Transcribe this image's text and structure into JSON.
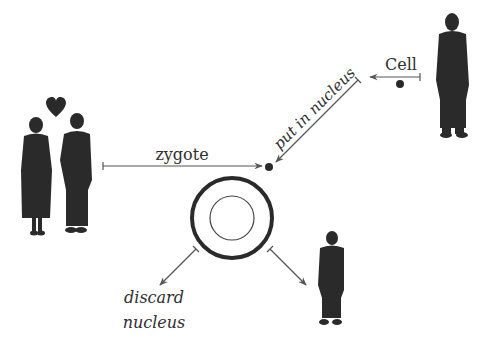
{
  "diagram": {
    "labels": {
      "zygote": "zygote",
      "cell": "Cell",
      "put_in_nucleus": "put in nucleus",
      "discard_line1": "discard",
      "discard_line2": "nucleus"
    },
    "nodes": [
      {
        "id": "parents",
        "kind": "couple-silhouette",
        "note": "heart-icon above"
      },
      {
        "id": "donor",
        "kind": "person-silhouette"
      },
      {
        "id": "egg",
        "kind": "egg-cell"
      },
      {
        "id": "clone",
        "kind": "person-silhouette"
      },
      {
        "id": "donor-nucleus",
        "kind": "dot"
      },
      {
        "id": "zygote-dot",
        "kind": "dot"
      }
    ],
    "edges": [
      {
        "from": "parents",
        "to": "zygote-dot",
        "label": "zygote"
      },
      {
        "from": "donor",
        "to": "donor-nucleus",
        "label": "Cell"
      },
      {
        "from": "donor-nucleus",
        "to": "zygote-dot",
        "label": "put in nucleus"
      },
      {
        "from": "egg",
        "to": "discard",
        "label": "discard nucleus"
      },
      {
        "from": "egg",
        "to": "clone",
        "label": ""
      }
    ],
    "colors": {
      "ink": "#2a2a2a",
      "line": "#555555"
    }
  }
}
